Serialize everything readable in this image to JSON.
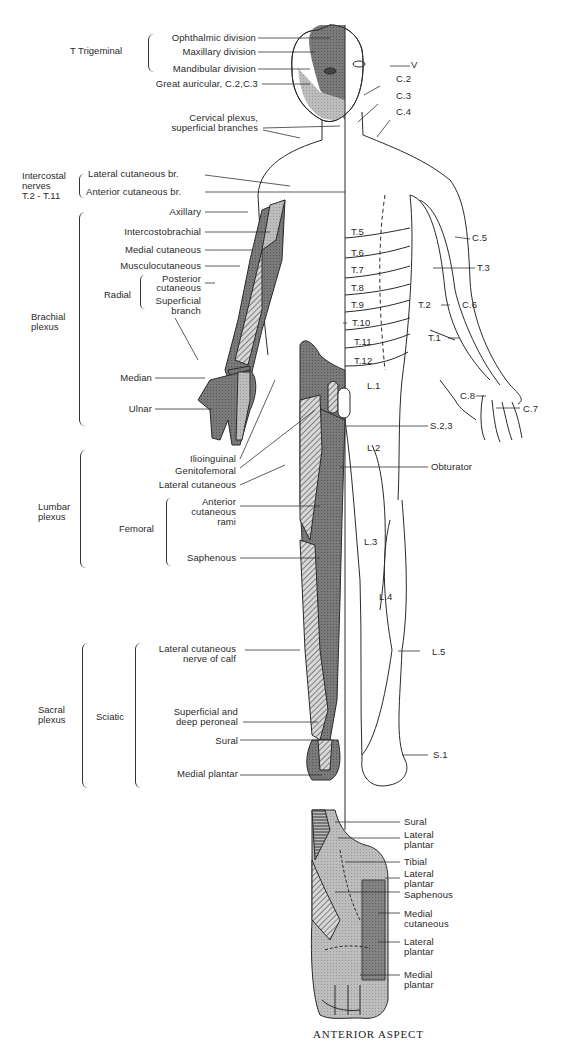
{
  "figure": {
    "caption": "ANTERIOR ASPECT",
    "colors": {
      "dark_fill": "#6a6a6a",
      "mid_fill": "#8e8e8e",
      "light_fill": "#c4c4c4",
      "line": "#2a2a2a",
      "background": "#ffffff"
    }
  },
  "left_groups": {
    "trigeminal": "T  Trigeminal",
    "intercostal": [
      "Intercostal",
      "nerves",
      "T.2 - T.11"
    ],
    "brachial": [
      "Brachial",
      "plexus"
    ],
    "radial": "Radial",
    "lumbar": [
      "Lumbar",
      "plexus"
    ],
    "femoral": "Femoral",
    "sacral": [
      "Sacral",
      "plexus"
    ],
    "sciatic": "Sciatic"
  },
  "left_labels": {
    "ophthalmic": "Ophthalmic division",
    "maxillary": "Maxillary division",
    "mandibular": "Mandibular division",
    "great_auricular": "Great auricular, C.2,C.3",
    "cervical_1": "Cervical plexus,",
    "cervical_2": "superficial branches",
    "lateral_cut_br": "Lateral cutaneous br.",
    "anterior_cut_br": "Anterior cutaneous br.",
    "axillary": "Axillary",
    "intercostobrachial": "Intercostobrachial",
    "medial_cutaneous": "Medial cutaneous",
    "musculocutaneous": "Musculocutaneous",
    "posterior_1": "Posterior",
    "posterior_2": "cutaneous",
    "superficial_1": "Superficial",
    "superficial_2": "branch",
    "median": "Median",
    "ulnar": "Ulnar",
    "ilioinguinal": "Ilioinguinal",
    "genitofemoral": "Genitofemoral",
    "lateral_cutaneous": "Lateral cutaneous",
    "anterior_rami_1": "Anterior",
    "anterior_rami_2": "cutaneous",
    "anterior_rami_3": "rami",
    "saphenous": "Saphenous",
    "calf_1": "Lateral cutaneous",
    "calf_2": "nerve of calf",
    "peroneal_1": "Superficial and",
    "peroneal_2": "deep peroneal",
    "sural": "Sural",
    "medial_plantar": "Medial plantar"
  },
  "dermatomes": {
    "V": "V",
    "C2": "C.2",
    "C3": "C.3",
    "C4": "C.4",
    "C5": "C.5",
    "C6": "C.6",
    "C7": "C.7",
    "C8": "C.8",
    "T1": "T.1",
    "T2": "T.2",
    "T3": "T.3",
    "T5": "T.5",
    "T6": "T.6",
    "T7": "T.7",
    "T8": "T.8",
    "T9": "T.9",
    "T10": "T.10",
    "T11": "T.11",
    "T12": "T.12",
    "L1": "L.1",
    "L2": "L.2",
    "L3": "L.3",
    "L4": "L.4",
    "L5": "L.5",
    "S1": "S.1",
    "S23": "S.2,3",
    "obturator": "Obturator"
  },
  "foot_labels": {
    "sural": "Sural",
    "lateral_plantar_1a": "Lateral",
    "lateral_plantar_1b": "plantar",
    "tibial": "Tibial",
    "lateral_plantar_2a": "Lateral",
    "lateral_plantar_2b": "plantar",
    "saphenous": "Saphenous",
    "medial_cut_a": "Medial",
    "medial_cut_b": "cutaneous",
    "lateral_plantar_3a": "Lateral",
    "lateral_plantar_3b": "plantar",
    "medial_plantar_a": "Medial",
    "medial_plantar_b": "plantar"
  }
}
